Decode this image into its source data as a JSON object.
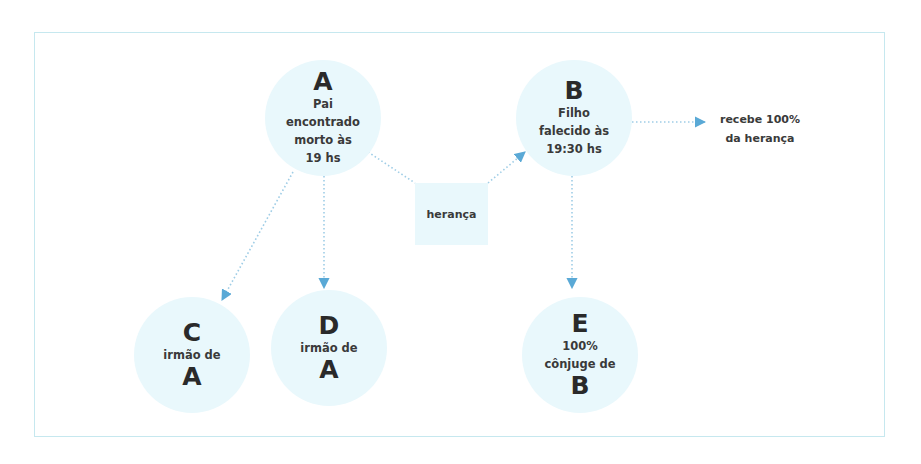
{
  "diagram": {
    "nodes": {
      "A": {
        "letter": "A",
        "lines": [
          "Pai",
          "encontrado",
          "morto às",
          "19 hs"
        ]
      },
      "B": {
        "letter": "B",
        "lines": [
          "Filho",
          "falecido às",
          "19:30 hs"
        ]
      },
      "C": {
        "letter": "C",
        "label": "irmão de",
        "ref": "A"
      },
      "D": {
        "letter": "D",
        "label": "irmão de",
        "ref": "A"
      },
      "E": {
        "letter": "E",
        "lines": [
          "100%",
          "cônjuge de"
        ],
        "ref": "B"
      }
    },
    "transfer_box": {
      "label": "herança"
    },
    "outcome_note": {
      "lines": [
        "recebe 100%",
        "da herança"
      ]
    },
    "colors": {
      "node_fill": "#e9f8fc",
      "arrow": "#5aa9d6",
      "frame": "#c6e8ef"
    }
  }
}
